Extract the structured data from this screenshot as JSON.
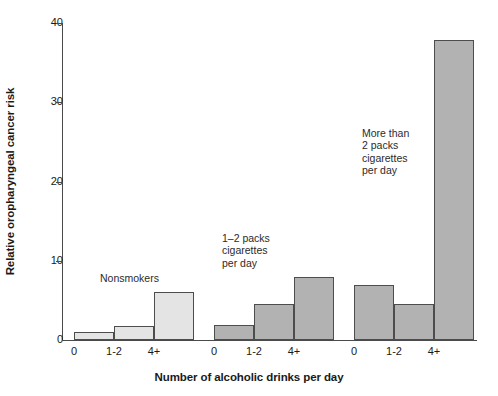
{
  "chart_data": {
    "type": "bar",
    "title": "",
    "subtitle": "",
    "xlabel": "Number of alcoholic drinks per day",
    "ylabel": "Relative oropharyngeal cancer risk",
    "ylim": [
      0,
      40
    ],
    "yticks": [
      0,
      10,
      20,
      30,
      40
    ],
    "ytick_labels": [
      "0",
      "10",
      "20",
      "30",
      "40"
    ],
    "grid": false,
    "legend_position": "inline-annotations",
    "categories": [
      "0",
      "1-2",
      "4+"
    ],
    "series": [
      {
        "name": "Nonsmokers",
        "color": "#e4e4e4",
        "values": [
          1.0,
          1.8,
          6.0
        ]
      },
      {
        "name": "1-2 packs cigarettes per day",
        "color": "#b2b2b2",
        "values": [
          1.9,
          4.5,
          8.0
        ]
      },
      {
        "name": "More than 2 packs cigarettes per day",
        "color": "#b2b2b2",
        "values": [
          7.0,
          4.5,
          37.8
        ]
      }
    ],
    "bars": [
      {
        "group": 0,
        "category": "0",
        "value": 1.0,
        "color": "#e4e4e4"
      },
      {
        "group": 0,
        "category": "1-2",
        "value": 1.8,
        "color": "#e4e4e4"
      },
      {
        "group": 0,
        "category": "4+",
        "value": 6.0,
        "color": "#e4e4e4"
      },
      {
        "group": 1,
        "category": "0",
        "value": 1.9,
        "color": "#b2b2b2"
      },
      {
        "group": 1,
        "category": "1-2",
        "value": 4.5,
        "color": "#b2b2b2"
      },
      {
        "group": 1,
        "category": "4+",
        "value": 8.0,
        "color": "#b2b2b2"
      },
      {
        "group": 2,
        "category": "0",
        "value": 7.0,
        "color": "#b2b2b2"
      },
      {
        "group": 2,
        "category": "1-2",
        "value": 4.5,
        "color": "#b2b2b2"
      },
      {
        "group": 2,
        "category": "4+",
        "value": 37.8,
        "color": "#b2b2b2"
      }
    ],
    "annotations": [
      {
        "text": "Nonsmokers",
        "group": 0
      },
      {
        "text": "1–2 packs\ncigarettes\nper day",
        "group": 1
      },
      {
        "text": "More than\n2 packs\ncigarettes\nper day",
        "group": 2
      }
    ],
    "xtick_labels": [
      "0",
      "1-2",
      "4+",
      "0",
      "1-2",
      "4+",
      "0",
      "1-2",
      "4+"
    ],
    "axis_color": "#4a4a4a",
    "bar_edge_color": "#4d4d4d",
    "background": "#ffffff"
  }
}
